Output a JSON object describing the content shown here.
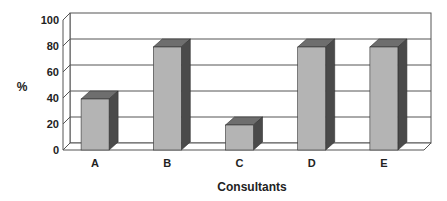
{
  "chart_data": {
    "type": "bar",
    "style": "3d-column",
    "title": "",
    "categories": [
      "A",
      "B",
      "C",
      "D",
      "E"
    ],
    "values": [
      40,
      80,
      20,
      80,
      80
    ],
    "xlabel": "Consultants",
    "ylabel": "%",
    "ylim": [
      0,
      100
    ],
    "yticks": [
      0,
      20,
      40,
      60,
      80,
      100
    ],
    "grid": true,
    "legend": null
  },
  "colors": {
    "bar_front": "#b4b4b4",
    "bar_top": "#6e6e6e",
    "bar_side": "#4a4a4a",
    "grid": "#555555",
    "wall": "#ffffff"
  }
}
